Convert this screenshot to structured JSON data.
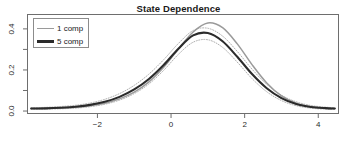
{
  "chart_data": {
    "type": "line",
    "title": "State Dependence",
    "xlabel": "",
    "ylabel": "",
    "xlim": [
      -3.9,
      4.55
    ],
    "ylim": [
      -0.012,
      0.47
    ],
    "grid": false,
    "legend_position": "top-left",
    "xticks": [
      -2,
      0,
      2,
      4
    ],
    "xtick_labels": [
      "−2",
      "0",
      "2",
      "4"
    ],
    "yticks": [
      0.0,
      0.2,
      0.4
    ],
    "ytick_labels": [
      "0.0",
      "0.2",
      "0.4"
    ],
    "yticks_minor": [
      0.1,
      0.3,
      0.5
    ],
    "series": [
      {
        "name": "1 comp",
        "color": "#9a9a9a",
        "width": 1.5,
        "style": "solid",
        "x": [
          -3.8,
          -3.4,
          -3.0,
          -2.6,
          -2.2,
          -1.8,
          -1.4,
          -1.0,
          -0.6,
          -0.2,
          0.2,
          0.6,
          1.0,
          1.4,
          1.8,
          2.2,
          2.6,
          3.0,
          3.4,
          3.8,
          4.2,
          4.45
        ],
        "values": [
          0.012,
          0.013,
          0.015,
          0.019,
          0.026,
          0.038,
          0.059,
          0.092,
          0.142,
          0.213,
          0.302,
          0.385,
          0.429,
          0.406,
          0.327,
          0.226,
          0.137,
          0.074,
          0.038,
          0.021,
          0.014,
          0.012
        ]
      },
      {
        "name": "5 comp",
        "color": "#2b2b2b",
        "width": 2.1,
        "style": "solid",
        "x": [
          -3.8,
          -3.4,
          -3.0,
          -2.6,
          -2.2,
          -1.8,
          -1.4,
          -1.0,
          -0.6,
          -0.2,
          0.2,
          0.6,
          1.0,
          1.4,
          1.8,
          2.2,
          2.6,
          3.0,
          3.4,
          3.8,
          4.2,
          4.45
        ],
        "values": [
          0.012,
          0.013,
          0.016,
          0.021,
          0.03,
          0.045,
          0.069,
          0.105,
          0.156,
          0.224,
          0.303,
          0.368,
          0.38,
          0.34,
          0.264,
          0.18,
          0.111,
          0.063,
          0.034,
          0.02,
          0.014,
          0.012
        ]
      }
    ],
    "confidence_bands": [
      {
        "name": "5 comp upper",
        "color": "#b0b0b0",
        "style": "dotted",
        "x": [
          -3.8,
          -3.4,
          -3.0,
          -2.6,
          -2.2,
          -1.8,
          -1.4,
          -1.0,
          -0.6,
          -0.2,
          0.2,
          0.6,
          1.0,
          1.4,
          1.8,
          2.2,
          2.6,
          3.0,
          3.4,
          3.8,
          4.2,
          4.45
        ],
        "values": [
          0.016,
          0.018,
          0.022,
          0.028,
          0.039,
          0.057,
          0.085,
          0.125,
          0.18,
          0.25,
          0.329,
          0.392,
          0.403,
          0.365,
          0.29,
          0.204,
          0.13,
          0.077,
          0.045,
          0.027,
          0.019,
          0.016
        ]
      },
      {
        "name": "5 comp lower",
        "color": "#b0b0b0",
        "style": "dotted",
        "x": [
          -3.8,
          -3.4,
          -3.0,
          -2.6,
          -2.2,
          -1.8,
          -1.4,
          -1.0,
          -0.6,
          -0.2,
          0.2,
          0.6,
          1.0,
          1.4,
          1.8,
          2.2,
          2.6,
          3.0,
          3.4,
          3.8,
          4.2,
          4.45
        ],
        "values": [
          0.008,
          0.009,
          0.011,
          0.014,
          0.021,
          0.033,
          0.053,
          0.085,
          0.132,
          0.198,
          0.276,
          0.335,
          0.347,
          0.31,
          0.238,
          0.158,
          0.094,
          0.051,
          0.026,
          0.014,
          0.009,
          0.008
        ]
      }
    ],
    "legend": [
      {
        "label": "1 comp",
        "color": "#9a9a9a",
        "width": 1.5
      },
      {
        "label": "5 comp",
        "color": "#2b2b2b",
        "width": 2.3
      }
    ]
  },
  "axis": {
    "frame_color": "#6e6e6e",
    "tick_color": "#6e6e6e",
    "label_color": "#2b2b2b"
  }
}
